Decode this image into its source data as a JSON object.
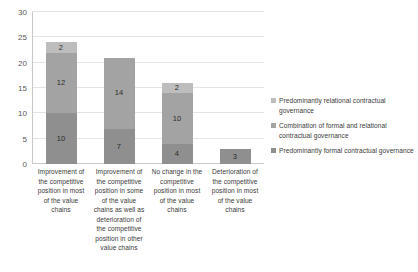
{
  "chart_data": {
    "type": "bar",
    "subtype": "stacked-bar",
    "title": "",
    "xlabel": "",
    "ylabel": "",
    "ylim": [
      0,
      30
    ],
    "ytick_values": [
      0,
      5,
      10,
      15,
      20,
      25,
      30
    ],
    "ytick_labels": [
      "0",
      "5",
      "10",
      "15",
      "20",
      "25",
      "30"
    ],
    "grid": true,
    "grid_axis": "y",
    "legend_position": "right",
    "categories": [
      "Improvement of the competitive position in most of the value chains",
      "Improvement of the competitive position in some of the value chains as well as deterioration of the competitive position in other value chains",
      "No change in the competitive position in most of the value chains",
      "Deterioration of the competitive position in most of the value chains"
    ],
    "series": [
      {
        "name": "Predominantly formal contractual governance",
        "color": "#8f8f8f",
        "values": [
          10,
          7,
          4,
          3
        ],
        "labels": [
          "10",
          "7",
          "4",
          "3"
        ]
      },
      {
        "name": "Combination of formal and relational contractual governance",
        "color": "#a3a3a3",
        "values": [
          12,
          14,
          10,
          0
        ],
        "labels": [
          "12",
          "14",
          "10",
          ""
        ]
      },
      {
        "name": "Predominantly relational contractual governance",
        "color": "#bdbdbd",
        "values": [
          2,
          0,
          2,
          0
        ],
        "labels": [
          "2",
          "",
          "2",
          ""
        ]
      }
    ],
    "totals": [
      24,
      21,
      16,
      3
    ]
  },
  "legend": {
    "items": [
      {
        "label": "Predominantly relational contractual governance",
        "color": "#bdbdbd"
      },
      {
        "label": "Combination of formal and relational contractual governance",
        "color": "#a3a3a3"
      },
      {
        "label": "Predominantly formal contractual governance",
        "color": "#8f8f8f"
      }
    ]
  },
  "colors": {
    "relational": "#bdbdbd",
    "combination": "#a3a3a3",
    "formal": "#8f8f8f",
    "gridline": "#e4e4e4",
    "axis": "#c9c9c9",
    "text": "#3b3b3b"
  }
}
